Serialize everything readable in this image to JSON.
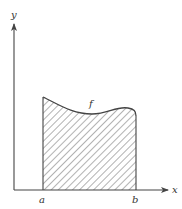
{
  "figure": {
    "axis_labels": {
      "x": "x",
      "y": "y"
    },
    "function_label": "f",
    "interval": {
      "left": "a",
      "right": "b"
    },
    "colors": {
      "stroke": "#444444",
      "hatch": "#555555",
      "background": "#ffffff"
    }
  }
}
